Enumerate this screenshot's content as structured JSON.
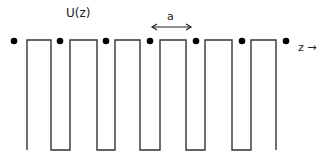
{
  "diagram": {
    "title_label": "U(z)",
    "period_label": "a",
    "axis_label": "z →",
    "line_color": "#333333",
    "dot_color": "#000000",
    "wells": [
      {
        "left": 51,
        "right": 70
      },
      {
        "left": 97,
        "right": 115
      },
      {
        "left": 140,
        "right": 160
      },
      {
        "left": 186,
        "right": 205
      },
      {
        "left": 232,
        "right": 251
      }
    ],
    "dots_x": [
      14,
      60,
      106,
      150,
      196,
      242,
      286
    ]
  }
}
